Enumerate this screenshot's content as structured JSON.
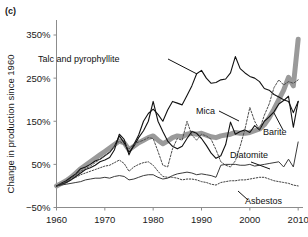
{
  "figure": {
    "panel_label": "(c)",
    "ylabel": "Change in production since 1960"
  },
  "chart_data": {
    "type": "line",
    "title": "",
    "xlabel": "",
    "ylabel": "Change in production since 1960",
    "xlim": [
      1960,
      2011
    ],
    "ylim": [
      -50,
      390
    ],
    "yticks": [
      -50,
      50,
      150,
      250,
      350
    ],
    "ytick_labels": [
      "−50%",
      "50%",
      "150%",
      "250%",
      "350%"
    ],
    "xticks": [
      1960,
      1970,
      1980,
      1990,
      2000,
      2010
    ],
    "xtick_labels": [
      "1960",
      "1970",
      "1980",
      "1990",
      "2000",
      "2010"
    ],
    "grid": false,
    "legend": "inline-annotations",
    "annotations": [
      {
        "text": "Talc and  pyrophyllite",
        "x": 38,
        "y": 62,
        "anchor": "start",
        "leader": [
          [
            168,
            59
          ],
          [
            197,
            74
          ]
        ]
      },
      {
        "text": "Mica",
        "x": 196,
        "y": 114,
        "anchor": "start",
        "leader": [
          [
            219,
            111
          ],
          [
            239,
            121
          ]
        ]
      },
      {
        "text": "Barite",
        "x": 263,
        "y": 135,
        "anchor": "start",
        "leader": [
          [
            283,
            130
          ],
          [
            274,
            113
          ]
        ]
      },
      {
        "text": "Diatomite",
        "x": 230,
        "y": 158,
        "anchor": "start",
        "leader": [
          [
            251,
            162
          ],
          [
            270,
            169
          ]
        ]
      },
      {
        "text": "Asbestos",
        "x": 245,
        "y": 204,
        "anchor": "start",
        "leader": [
          [
            248,
            200
          ],
          [
            238,
            191
          ]
        ]
      }
    ],
    "series": [
      {
        "name": "Talc and pyrophyllite",
        "style": "solid-thin-black",
        "color": "#111111",
        "width": 1.1,
        "dash": "none",
        "x": [
          1960,
          1961,
          1962,
          1963,
          1964,
          1965,
          1966,
          1967,
          1968,
          1969,
          1970,
          1971,
          1972,
          1973,
          1974,
          1975,
          1976,
          1977,
          1978,
          1979,
          1980,
          1981,
          1982,
          1983,
          1984,
          1985,
          1986,
          1987,
          1988,
          1989,
          1990,
          1991,
          1992,
          1993,
          1994,
          1995,
          1996,
          1997,
          1998,
          1999,
          2000,
          2001,
          2002,
          2003,
          2004,
          2005,
          2006,
          2007,
          2008,
          2009,
          2010
        ],
        "values": [
          0,
          4,
          8,
          14,
          22,
          30,
          38,
          42,
          48,
          56,
          60,
          66,
          84,
          120,
          108,
          72,
          96,
          118,
          150,
          168,
          178,
          166,
          150,
          176,
          196,
          192,
          188,
          210,
          232,
          260,
          268,
          250,
          238,
          240,
          246,
          248,
          262,
          300,
          272,
          262,
          254,
          250,
          242,
          226,
          222,
          212,
          206,
          200,
          196,
          170,
          196
        ]
      },
      {
        "name": "Barite",
        "style": "solid-thin-black-2",
        "color": "#111111",
        "width": 1.1,
        "dash": "none",
        "x": [
          1960,
          1961,
          1962,
          1963,
          1964,
          1965,
          1966,
          1967,
          1968,
          1969,
          1970,
          1971,
          1972,
          1973,
          1974,
          1975,
          1976,
          1977,
          1978,
          1979,
          1980,
          1981,
          1982,
          1983,
          1984,
          1985,
          1986,
          1987,
          1988,
          1989,
          1990,
          1991,
          1992,
          1993,
          1994,
          1995,
          1996,
          1997,
          1998,
          1999,
          2000,
          2001,
          2002,
          2003,
          2004,
          2005,
          2006,
          2007,
          2008,
          2009,
          2010
        ],
        "values": [
          0,
          6,
          12,
          20,
          28,
          40,
          44,
          50,
          58,
          62,
          70,
          78,
          92,
          116,
          100,
          78,
          92,
          112,
          128,
          150,
          196,
          150,
          126,
          104,
          92,
          86,
          92,
          110,
          126,
          122,
          110,
          94,
          76,
          64,
          70,
          96,
          148,
          120,
          126,
          130,
          124,
          140,
          130,
          150,
          160,
          172,
          190,
          198,
          208,
          136,
          196
        ]
      },
      {
        "name": "Mica",
        "style": "dotted-gray",
        "color": "#4d4d4d",
        "width": 1.0,
        "dash": "2,1.6",
        "x": [
          1960,
          1961,
          1962,
          1963,
          1964,
          1965,
          1966,
          1967,
          1968,
          1969,
          1970,
          1971,
          1972,
          1973,
          1974,
          1975,
          1976,
          1977,
          1978,
          1979,
          1980,
          1981,
          1982,
          1983,
          1984,
          1985,
          1986,
          1987,
          1988,
          1989,
          1990,
          1991,
          1992,
          1993,
          1994,
          1995,
          1996,
          1997,
          1998,
          1999,
          2000,
          2001,
          2002,
          2003,
          2004,
          2005,
          2006,
          2007,
          2008,
          2009,
          2010
        ],
        "values": [
          0,
          6,
          10,
          18,
          26,
          34,
          40,
          46,
          54,
          62,
          70,
          78,
          92,
          104,
          96,
          86,
          96,
          102,
          106,
          112,
          110,
          80,
          48,
          44,
          86,
          110,
          106,
          150,
          118,
          106,
          120,
          116,
          108,
          84,
          56,
          48,
          44,
          58,
          92,
          132,
          182,
          150,
          130,
          164,
          190,
          228,
          246,
          234,
          242,
          238,
          246
        ]
      },
      {
        "name": "Diatomite",
        "style": "solid-thin-dark",
        "color": "#3a3a3a",
        "width": 1.0,
        "dash": "none",
        "x": [
          1960,
          1961,
          1962,
          1963,
          1964,
          1965,
          1966,
          1967,
          1968,
          1969,
          1970,
          1971,
          1972,
          1973,
          1974,
          1975,
          1976,
          1977,
          1978,
          1979,
          1980,
          1981,
          1982,
          1983,
          1984,
          1985,
          1986,
          1987,
          1988,
          1989,
          1990,
          1991,
          1992,
          1993,
          1994,
          1995,
          1996,
          1997,
          1998,
          1999,
          2000,
          2001,
          2002,
          2003,
          2004,
          2005,
          2006,
          2007,
          2008,
          2009,
          2010
        ],
        "values": [
          0,
          2,
          4,
          6,
          8,
          10,
          14,
          16,
          18,
          18,
          20,
          18,
          22,
          24,
          22,
          14,
          16,
          20,
          24,
          26,
          26,
          20,
          16,
          18,
          24,
          28,
          30,
          32,
          30,
          26,
          28,
          26,
          24,
          20,
          48,
          50,
          50,
          50,
          48,
          48,
          50,
          46,
          48,
          50,
          52,
          54,
          56,
          44,
          62,
          44,
          102
        ]
      },
      {
        "name": "Asbestos",
        "style": "dotted-fine-dark",
        "color": "#2a2a2a",
        "width": 0.9,
        "dash": "1.4,1.6",
        "x": [
          1960,
          1961,
          1962,
          1963,
          1964,
          1965,
          1966,
          1967,
          1968,
          1969,
          1970,
          1971,
          1972,
          1973,
          1974,
          1975,
          1976,
          1977,
          1978,
          1979,
          1980,
          1981,
          1982,
          1983,
          1984,
          1985,
          1986,
          1987,
          1988,
          1989,
          1990,
          1991,
          1992,
          1993,
          1994,
          1995,
          1996,
          1997,
          1998,
          1999,
          2000,
          2001,
          2002,
          2003,
          2004,
          2005,
          2006,
          2007,
          2008,
          2009,
          2010
        ],
        "values": [
          0,
          4,
          8,
          14,
          20,
          26,
          30,
          34,
          38,
          42,
          46,
          48,
          54,
          60,
          52,
          34,
          44,
          50,
          54,
          56,
          48,
          34,
          22,
          20,
          20,
          18,
          14,
          16,
          16,
          14,
          10,
          8,
          4,
          2,
          8,
          10,
          12,
          12,
          14,
          14,
          16,
          18,
          20,
          20,
          16,
          12,
          10,
          8,
          6,
          2,
          0
        ]
      },
      {
        "name": "Aggregate (thick gray)",
        "style": "thick-gray",
        "color": "#9a9a9a",
        "width": 5.0,
        "dash": "none",
        "x": [
          1960,
          1961,
          1962,
          1963,
          1964,
          1965,
          1966,
          1967,
          1968,
          1969,
          1970,
          1971,
          1972,
          1973,
          1974,
          1975,
          1976,
          1977,
          1978,
          1979,
          1980,
          1981,
          1982,
          1983,
          1984,
          1985,
          1986,
          1987,
          1988,
          1989,
          1990,
          1991,
          1992,
          1993,
          1994,
          1995,
          1996,
          1997,
          1998,
          1999,
          2000,
          2001,
          2002,
          2003,
          2004,
          2005,
          2006,
          2007,
          2008,
          2009,
          2010
        ],
        "values": [
          0,
          6,
          12,
          20,
          30,
          40,
          48,
          56,
          64,
          72,
          80,
          88,
          96,
          104,
          100,
          84,
          92,
          100,
          106,
          112,
          116,
          106,
          98,
          104,
          112,
          116,
          114,
          120,
          122,
          120,
          122,
          118,
          114,
          112,
          116,
          118,
          120,
          124,
          122,
          122,
          124,
          128,
          132,
          142,
          158,
          178,
          200,
          222,
          252,
          232,
          340
        ]
      }
    ]
  }
}
